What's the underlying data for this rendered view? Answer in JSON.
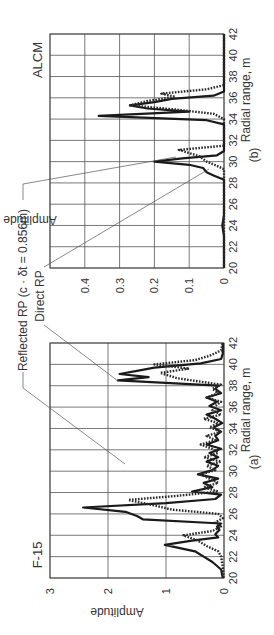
{
  "figure": {
    "annotations": {
      "reflected_rp": "Reflected RP (c · δt = 0.856m)",
      "direct_rp": "Direct RP"
    }
  },
  "chart_data": [
    {
      "id": "a",
      "type": "line",
      "title": "F-15",
      "caption": "(a)",
      "xlabel": "Radial range, m",
      "ylabel": "Amplitude",
      "xlim": [
        20,
        42
      ],
      "ylim": [
        0,
        3
      ],
      "xticks": [
        "20",
        "22",
        "24",
        "26",
        "28",
        "30",
        "32",
        "34",
        "36",
        "38",
        "40",
        "42"
      ],
      "yticks": [
        "0",
        "1",
        "2",
        "3"
      ],
      "grid": true,
      "series": [
        {
          "name": "Direct RP",
          "style": "solid",
          "x": [
            20,
            20.8,
            21.5,
            22,
            22.5,
            23.1,
            23.5,
            23.8,
            24.1,
            24.5,
            24.8,
            25.1,
            25.5,
            25.8,
            26.2,
            26.6,
            27.0,
            27.4,
            27.8,
            28.1,
            28.5,
            28.9,
            29.3,
            29.7,
            30.1,
            30.5,
            30.9,
            31.3,
            31.7,
            32.1,
            32.5,
            32.9,
            33.3,
            33.7,
            34.1,
            34.5,
            34.9,
            35.3,
            35.7,
            36.1,
            36.5,
            36.9,
            37.3,
            37.7,
            38.0,
            38.5,
            38.8,
            39.1,
            39.4,
            39.7,
            40.1,
            40.5,
            41,
            42
          ],
          "values": [
            0.02,
            0.05,
            0.2,
            0.35,
            0.5,
            1.02,
            0.55,
            0.1,
            0.15,
            0.08,
            0.12,
            0.05,
            1.4,
            1.5,
            1.7,
            2.43,
            1.0,
            0.15,
            0.05,
            0.55,
            0.2,
            0.35,
            0.1,
            0.45,
            0.2,
            0.1,
            0.3,
            0.1,
            0.25,
            0.05,
            0.3,
            0.1,
            0.15,
            0.05,
            0.18,
            0.03,
            0.15,
            0.3,
            0.05,
            0.25,
            0.12,
            0.3,
            0.05,
            0.15,
            0.1,
            1.83,
            1.3,
            1.8,
            1.5,
            1.2,
            0.4,
            0.05,
            0.02,
            0.02
          ]
        },
        {
          "name": "Reflected RP",
          "style": "dotted",
          "x": [
            20,
            21,
            22,
            22.5,
            23,
            23.5,
            24.0,
            24.4,
            24.8,
            25.2,
            25.6,
            26.0,
            26.4,
            26.8,
            27.3,
            27.7,
            28.1,
            28.5,
            28.9,
            29.3,
            29.7,
            30.1,
            30.5,
            30.9,
            31.3,
            31.7,
            32.1,
            32.5,
            32.9,
            33.3,
            33.7,
            34.1,
            34.5,
            34.9,
            35.3,
            35.7,
            36.1,
            36.5,
            36.9,
            37.3,
            37.7,
            38.1,
            38.7,
            39.2,
            39.6,
            40.0,
            40.4,
            40.8,
            41.3,
            42
          ],
          "values": [
            0.01,
            0.02,
            0.05,
            0.1,
            0.3,
            0.45,
            0.7,
            0.2,
            0.05,
            0.15,
            0.02,
            0.1,
            0.9,
            1.2,
            1.65,
            0.8,
            0.1,
            0.35,
            0.1,
            0.25,
            0.4,
            0.15,
            0.3,
            0.05,
            0.35,
            0.1,
            0.2,
            0.4,
            0.15,
            0.3,
            0.05,
            0.25,
            0.1,
            0.35,
            0.05,
            0.2,
            0.15,
            0.05,
            0.3,
            0.1,
            0.2,
            0.05,
            0.8,
            1.1,
            0.6,
            1.2,
            0.5,
            0.25,
            0.05,
            0.02
          ]
        }
      ]
    },
    {
      "id": "b",
      "type": "line",
      "title": "ALCM",
      "caption": "(b)",
      "xlabel": "Radial range, m",
      "ylabel": "Amplitude",
      "xlim": [
        20,
        42
      ],
      "ylim": [
        0,
        0.5
      ],
      "xticks": [
        "20",
        "22",
        "24",
        "26",
        "28",
        "30",
        "32",
        "34",
        "36",
        "38",
        "40",
        "42"
      ],
      "yticks": [
        "0",
        "0.1",
        "0.2",
        "0.3",
        "0.4"
      ],
      "grid": true,
      "series": [
        {
          "name": "Direct RP",
          "style": "solid",
          "x": [
            20,
            23,
            24,
            25,
            28.3,
            28.7,
            29.0,
            29.4,
            29.7,
            30.0,
            30.3,
            30.6,
            31.0,
            33.5,
            33.9,
            34.3,
            34.7,
            35.0,
            35.3,
            35.6,
            35.9,
            36.2,
            36.6,
            42
          ],
          "values": [
            0.0,
            0.0,
            0.005,
            0.0,
            0.0,
            0.03,
            0.05,
            0.06,
            0.1,
            0.2,
            0.12,
            0.02,
            0.0,
            0.0,
            0.05,
            0.36,
            0.1,
            0.22,
            0.27,
            0.2,
            0.15,
            0.03,
            0.0,
            0.0
          ]
        },
        {
          "name": "Reflected RP",
          "style": "dotted",
          "x": [
            20,
            29.3,
            29.6,
            30.0,
            30.5,
            31.1,
            31.5,
            34.0,
            34.5,
            34.9,
            35.3,
            35.7,
            36.1,
            36.4,
            36.8,
            37.2,
            42
          ],
          "values": [
            0.0,
            0.0,
            0.02,
            0.05,
            0.07,
            0.13,
            0.0,
            0.0,
            0.03,
            0.14,
            0.27,
            0.22,
            0.14,
            0.18,
            0.05,
            0.0,
            0.0
          ]
        }
      ]
    }
  ]
}
